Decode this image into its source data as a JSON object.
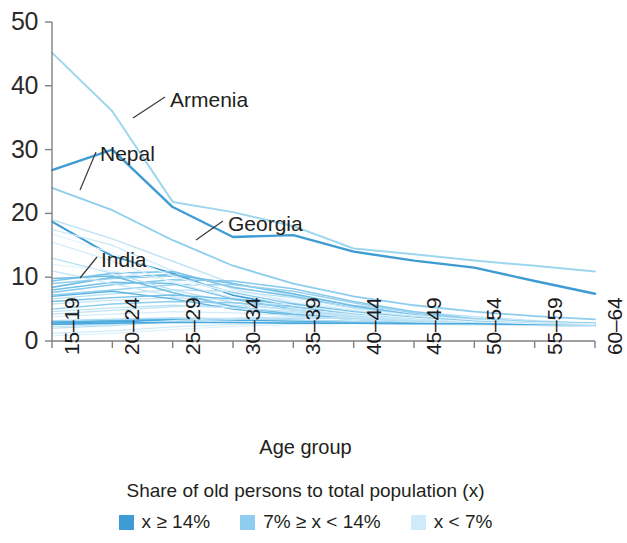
{
  "chart_data": {
    "type": "line",
    "title": "",
    "xlabel": "Age group",
    "ylabel": "",
    "ylim": [
      0,
      50
    ],
    "yticks": [
      0,
      10,
      20,
      30,
      40,
      50
    ],
    "grid": false,
    "legend_position": "bottom",
    "legend_title": "Share of old persons to total population (x)",
    "categories": [
      "15–19",
      "20–24",
      "25–29",
      "30–34",
      "35–39",
      "40–44",
      "45–49",
      "50–54",
      "55–59",
      "60–64"
    ],
    "legend": [
      {
        "label_parts": {
          "var": "x",
          "rel": "≥",
          "value": "14%"
        },
        "label": "x ≥ 14%",
        "color": "#3e9bd4"
      },
      {
        "label_parts": {
          "prefix": "7%",
          "rel1": "≥",
          "var": "x",
          "rel2": "<",
          "value": "14%"
        },
        "label": "7% ≥ x < 14%",
        "color": "#8ecdee"
      },
      {
        "label_parts": {
          "var": "x",
          "rel": "<",
          "value": "7%"
        },
        "label": "x < 7%",
        "color": "#cfeaf8"
      }
    ],
    "annotations": [
      {
        "text": "Armenia",
        "series": "Armenia",
        "label_x": 170,
        "label_y": 88,
        "leader_from": [
          165,
          97
        ],
        "leader_to": [
          133,
          118
        ]
      },
      {
        "text": "Nepal",
        "series": "Nepal",
        "label_x": 100,
        "label_y": 142,
        "leader_from": [
          96,
          152
        ],
        "leader_to": [
          80,
          190
        ]
      },
      {
        "text": "Georgia",
        "series": "Georgia",
        "label_x": 228,
        "label_y": 212,
        "leader_from": [
          223,
          221
        ],
        "leader_to": [
          196,
          240
        ]
      },
      {
        "text": "India",
        "series": "India",
        "label_x": 101,
        "label_y": 248,
        "leader_from": [
          97,
          257
        ],
        "leader_to": [
          80,
          278
        ]
      }
    ],
    "series": [
      {
        "name": "Armenia",
        "group": "x_lt_7",
        "color": "#9ed6f0",
        "width": 2.0,
        "values": [
          45.2,
          36.0,
          21.8,
          20.2,
          18.0,
          14.5,
          13.6,
          12.6,
          11.8,
          10.9
        ]
      },
      {
        "name": "Nepal",
        "group": "x_ge_14",
        "color": "#3e9bd4",
        "width": 2.4,
        "values": [
          26.8,
          30.0,
          21.0,
          16.3,
          16.6,
          14.0,
          12.6,
          11.5,
          9.4,
          7.4
        ]
      },
      {
        "name": "Georgia",
        "group": "x_lt_7",
        "color": "#8ecdee",
        "width": 1.8,
        "values": [
          24.0,
          20.5,
          15.8,
          11.8,
          9.0,
          7.0,
          5.6,
          4.6,
          3.9,
          3.4
        ]
      },
      {
        "name": "India",
        "group": "x_ge_14",
        "color": "#3e9bd4",
        "width": 2.0,
        "values": [
          18.7,
          13.3,
          10.6,
          7.2,
          5.4,
          4.0,
          3.2,
          2.7,
          2.5,
          2.4
        ]
      },
      {
        "name": "s5",
        "group": "x_lt_7",
        "color": "#bfe3f5",
        "width": 1.4,
        "values": [
          19.0,
          16.0,
          12.5,
          9.0,
          7.2,
          5.6,
          4.6,
          3.8,
          3.2,
          2.8
        ]
      },
      {
        "name": "s6",
        "group": "x_lt_7",
        "color": "#cfeaf8",
        "width": 1.4,
        "values": [
          17.5,
          15.0,
          11.0,
          8.2,
          6.0,
          4.8,
          4.0,
          3.3,
          2.9,
          2.6
        ]
      },
      {
        "name": "s7",
        "group": "x_mid",
        "color": "#7cc4e8",
        "width": 1.6,
        "values": [
          9.4,
          10.6,
          10.9,
          8.4,
          7.0,
          5.2,
          4.0,
          3.2,
          2.8,
          2.6
        ]
      },
      {
        "name": "s8",
        "group": "x_mid",
        "color": "#6ebde5",
        "width": 1.6,
        "values": [
          8.4,
          10.0,
          10.4,
          9.0,
          7.4,
          5.5,
          4.1,
          3.3,
          2.9,
          2.7
        ]
      },
      {
        "name": "s9",
        "group": "x_mid",
        "color": "#86c9ec",
        "width": 1.5,
        "values": [
          7.6,
          8.8,
          9.6,
          9.4,
          8.2,
          6.2,
          4.6,
          3.5,
          3.0,
          2.8
        ]
      },
      {
        "name": "s10",
        "group": "x_mid",
        "color": "#99d2ef",
        "width": 1.5,
        "values": [
          7.2,
          8.0,
          8.8,
          8.8,
          7.8,
          6.0,
          4.4,
          3.4,
          2.9,
          2.7
        ]
      },
      {
        "name": "s11",
        "group": "x_lt_7",
        "color": "#b7e0f4",
        "width": 1.3,
        "values": [
          6.6,
          7.4,
          8.0,
          7.8,
          6.8,
          5.2,
          4.0,
          3.2,
          2.8,
          2.6
        ]
      },
      {
        "name": "s12",
        "group": "x_lt_7",
        "color": "#c6e6f7",
        "width": 1.3,
        "values": [
          5.8,
          6.4,
          6.8,
          6.4,
          5.6,
          4.4,
          3.6,
          3.0,
          2.7,
          2.5
        ]
      },
      {
        "name": "s13",
        "group": "x_mid",
        "color": "#8ecdee",
        "width": 1.5,
        "values": [
          9.0,
          9.8,
          10.2,
          7.6,
          5.8,
          4.2,
          3.4,
          2.9,
          2.6,
          2.5
        ]
      },
      {
        "name": "s14",
        "group": "x_mid",
        "color": "#74c0e7",
        "width": 1.5,
        "values": [
          8.0,
          9.2,
          9.0,
          6.6,
          5.0,
          3.8,
          3.1,
          2.7,
          2.5,
          2.4
        ]
      },
      {
        "name": "s15",
        "group": "x_lt_7",
        "color": "#bfe3f5",
        "width": 1.3,
        "values": [
          4.2,
          4.8,
          5.4,
          5.6,
          5.0,
          4.0,
          3.3,
          2.9,
          2.6,
          2.5
        ]
      },
      {
        "name": "s16",
        "group": "x_mid",
        "color": "#5ab4e2",
        "width": 1.8,
        "values": [
          3.0,
          3.2,
          3.5,
          3.4,
          3.2,
          3.0,
          2.9,
          2.8,
          2.7,
          2.6
        ]
      },
      {
        "name": "s17",
        "group": "x_mid",
        "color": "#4aa9dc",
        "width": 1.8,
        "values": [
          2.8,
          3.0,
          3.3,
          3.3,
          3.1,
          2.9,
          2.8,
          2.8,
          2.7,
          2.6
        ]
      },
      {
        "name": "s18",
        "group": "x_lt_7",
        "color": "#aedbf2",
        "width": 1.4,
        "values": [
          3.2,
          3.4,
          3.6,
          3.5,
          3.3,
          3.1,
          3.0,
          2.9,
          2.8,
          2.7
        ]
      },
      {
        "name": "s19",
        "group": "x_lt_7",
        "color": "#d4ecf9",
        "width": 1.3,
        "values": [
          2.6,
          2.8,
          3.0,
          3.0,
          2.9,
          2.8,
          2.7,
          2.7,
          2.6,
          2.6
        ]
      },
      {
        "name": "s20",
        "group": "x_lt_7",
        "color": "#c6e6f7",
        "width": 1.3,
        "values": [
          11.0,
          9.0,
          7.0,
          5.4,
          4.4,
          3.6,
          3.1,
          2.8,
          2.6,
          2.5
        ]
      },
      {
        "name": "s21",
        "group": "x_lt_7",
        "color": "#b7e0f4",
        "width": 1.3,
        "values": [
          13.0,
          10.6,
          8.0,
          6.0,
          4.8,
          3.9,
          3.3,
          2.9,
          2.7,
          2.5
        ]
      },
      {
        "name": "s22",
        "group": "x_lt_7",
        "color": "#d4ecf9",
        "width": 1.3,
        "values": [
          15.5,
          12.5,
          9.2,
          6.8,
          5.2,
          4.1,
          3.4,
          2.9,
          2.7,
          2.5
        ]
      },
      {
        "name": "s23",
        "group": "x_mid",
        "color": "#6ebde5",
        "width": 1.5,
        "values": [
          9.8,
          10.2,
          7.6,
          5.4,
          4.2,
          3.5,
          3.0,
          2.8,
          2.6,
          2.5
        ]
      },
      {
        "name": "s24",
        "group": "x_mid",
        "color": "#5ab4e2",
        "width": 1.4,
        "values": [
          7.0,
          7.8,
          6.6,
          5.0,
          4.0,
          3.4,
          3.0,
          2.8,
          2.6,
          2.5
        ]
      },
      {
        "name": "s25",
        "group": "x_lt_7",
        "color": "#cfeaf8",
        "width": 1.2,
        "values": [
          1.2,
          1.6,
          2.2,
          2.6,
          2.8,
          2.8,
          2.7,
          2.6,
          2.5,
          2.4
        ]
      },
      {
        "name": "s26",
        "group": "x_lt_7",
        "color": "#dcf0fa",
        "width": 1.2,
        "values": [
          0.8,
          1.2,
          1.8,
          2.3,
          2.6,
          2.7,
          2.6,
          2.5,
          2.4,
          2.3
        ]
      },
      {
        "name": "s27",
        "group": "x_mid",
        "color": "#8ecdee",
        "width": 1.4,
        "values": [
          5.0,
          5.8,
          6.2,
          6.0,
          5.4,
          4.4,
          3.6,
          3.0,
          2.7,
          2.6
        ]
      },
      {
        "name": "s28",
        "group": "x_lt_7",
        "color": "#bfe3f5",
        "width": 1.3,
        "values": [
          4.6,
          5.2,
          5.6,
          5.2,
          4.6,
          3.8,
          3.2,
          2.9,
          2.6,
          2.5
        ]
      },
      {
        "name": "s29",
        "group": "x_lt_7",
        "color": "#d4ecf9",
        "width": 1.2,
        "values": [
          3.8,
          4.2,
          4.6,
          4.4,
          4.0,
          3.4,
          3.0,
          2.8,
          2.6,
          2.5
        ]
      },
      {
        "name": "s30",
        "group": "x_mid",
        "color": "#74c0e7",
        "width": 1.4,
        "values": [
          6.2,
          6.8,
          7.2,
          6.6,
          5.8,
          4.6,
          3.7,
          3.1,
          2.8,
          2.6
        ]
      },
      {
        "name": "s31",
        "group": "x_lt_7",
        "color": "#c6e6f7",
        "width": 1.2,
        "values": [
          2.2,
          2.6,
          3.2,
          3.6,
          3.8,
          3.6,
          3.2,
          2.9,
          2.7,
          2.6
        ]
      },
      {
        "name": "s32",
        "group": "x_lt_7",
        "color": "#b7e0f4",
        "width": 1.2,
        "values": [
          2.0,
          2.4,
          3.0,
          3.4,
          3.6,
          3.5,
          3.1,
          2.9,
          2.7,
          2.6
        ]
      },
      {
        "name": "s33",
        "group": "x_mid",
        "color": "#4aa9dc",
        "width": 1.6,
        "values": [
          2.6,
          2.8,
          2.9,
          2.9,
          2.8,
          2.8,
          2.7,
          2.7,
          2.6,
          2.6
        ]
      },
      {
        "name": "s34",
        "group": "x_lt_7",
        "color": "#e4f4fb",
        "width": 1.2,
        "values": [
          16.8,
          13.8,
          10.2,
          7.4,
          5.6,
          4.4,
          3.6,
          3.0,
          2.7,
          2.6
        ]
      },
      {
        "name": "s35",
        "group": "x_lt_7",
        "color": "#e4f4fb",
        "width": 1.2,
        "values": [
          12.0,
          11.0,
          9.4,
          7.8,
          6.4,
          5.0,
          4.0,
          3.3,
          2.9,
          2.7
        ]
      }
    ],
    "axes_geometry": {
      "plot_left": 52,
      "plot_right": 595,
      "plot_top": 22,
      "plot_bottom": 341,
      "axis_color": "#808080"
    }
  },
  "yaxis": {
    "ticks": [
      "50",
      "40",
      "30",
      "20",
      "10",
      "0"
    ]
  },
  "xaxis": {
    "title": "Age group",
    "ticks": [
      "15–19",
      "20–24",
      "25–29",
      "30–34",
      "35–39",
      "40–44",
      "45–49",
      "50–54",
      "55–59",
      "60–64"
    ]
  },
  "legend": {
    "title": "Share of old persons to total population (x)",
    "items": [
      {
        "text": "x ≥ 14%",
        "color": "#3e9bd4"
      },
      {
        "text": "7% ≥ x < 14%",
        "color": "#8ecdee"
      },
      {
        "text": "x < 7%",
        "color": "#cfeaf8"
      }
    ]
  }
}
